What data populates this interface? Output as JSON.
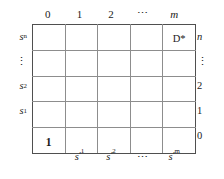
{
  "figure": {
    "type": "grid-diagram",
    "rows": 5,
    "columns": 5,
    "colors": {
      "background": "#ffffff",
      "grid_line": "#8d8d8d",
      "border": "#4f4f4f",
      "text": "#1a1a1a"
    }
  },
  "top_labels": [
    "0",
    "1",
    "2",
    "⋯",
    "m"
  ],
  "top_label_styles": [
    "plain",
    "plain",
    "plain",
    "dots",
    "italic"
  ],
  "bottom_labels": [
    "",
    "s′1",
    "s′2",
    "⋯",
    "s′m"
  ],
  "bottom_label_parts": [
    {
      "base": "",
      "sub": "",
      "prime": false
    },
    {
      "base": "s",
      "sub": "1",
      "prime": true
    },
    {
      "base": "s",
      "sub": "2",
      "prime": true
    },
    {
      "base": "⋯",
      "sub": "",
      "prime": false
    },
    {
      "base": "s",
      "sub": "m",
      "prime": true
    }
  ],
  "left_labels": [
    {
      "base": "s",
      "sub": "n"
    },
    {
      "base": "⋮",
      "sub": ""
    },
    {
      "base": "s",
      "sub": "2"
    },
    {
      "base": "s",
      "sub": "1"
    },
    {
      "base": "",
      "sub": ""
    }
  ],
  "right_labels": [
    "n",
    "⋮",
    "2",
    "1",
    "0"
  ],
  "right_label_styles": [
    "italic",
    "dots",
    "plain",
    "plain",
    "plain"
  ],
  "cells": [
    [
      "",
      "",
      "",
      "",
      "D*"
    ],
    [
      "",
      "",
      "",
      "",
      ""
    ],
    [
      "",
      "",
      "",
      "",
      ""
    ],
    [
      "",
      "",
      "",
      "",
      ""
    ],
    [
      "1",
      "",
      "",
      "",
      ""
    ]
  ],
  "cell_styles": [
    [
      "",
      "",
      "",
      "",
      "plain"
    ],
    [
      "",
      "",
      "",
      "",
      ""
    ],
    [
      "",
      "",
      "",
      "",
      ""
    ],
    [
      "",
      "",
      "",
      "",
      ""
    ],
    [
      "bold",
      "",
      "",
      "",
      ""
    ]
  ]
}
